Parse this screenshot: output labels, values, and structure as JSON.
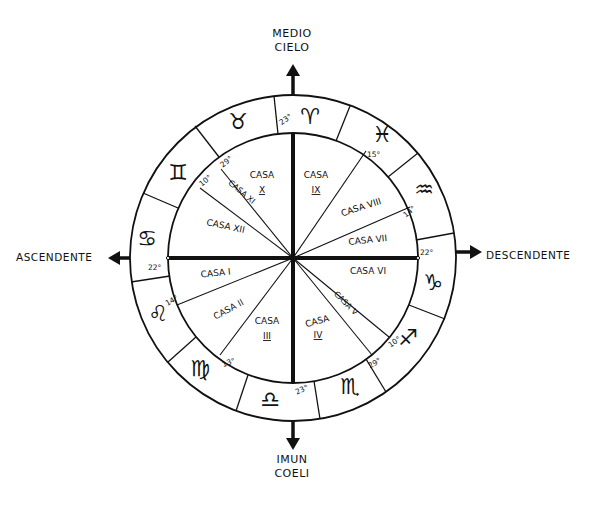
{
  "center": {
    "x": 293,
    "y": 258
  },
  "radii": {
    "outer": 163,
    "inner": 125
  },
  "axes": {
    "top": {
      "label_line1": "MEDIO",
      "label_line2": "CIELO",
      "degree": "23°"
    },
    "bottom": {
      "label_line1": "IMUN",
      "label_line2": "COELI",
      "degree": "23°"
    },
    "left": {
      "label": "ASCENDENTE",
      "degree": "22°"
    },
    "right": {
      "label": "DESCENDENTE",
      "degree": "22°"
    }
  },
  "houses": [
    {
      "id": "I",
      "label": "CASA I",
      "line1": "CASA I",
      "line2": ""
    },
    {
      "id": "II",
      "label": "CASA II",
      "line1": "CASA II",
      "line2": ""
    },
    {
      "id": "III",
      "label": "CASA III",
      "line1": "CASA",
      "line2": "III"
    },
    {
      "id": "IV",
      "label": "CASA IV",
      "line1": "CASA",
      "line2": "IV"
    },
    {
      "id": "V",
      "label": "CASA V",
      "line1": "CASA V",
      "line2": ""
    },
    {
      "id": "VI",
      "label": "CASA VI",
      "line1": "CASA VI",
      "line2": ""
    },
    {
      "id": "VII",
      "label": "CASA VII",
      "line1": "CASA VII",
      "line2": ""
    },
    {
      "id": "VIII",
      "label": "CASA VIII",
      "line1": "CASA VIII",
      "line2": ""
    },
    {
      "id": "IX",
      "label": "CASA IX",
      "line1": "CASA",
      "line2": "IX"
    },
    {
      "id": "X",
      "label": "CASA X",
      "line1": "CASA",
      "line2": "X"
    },
    {
      "id": "XI",
      "label": "CASA XI",
      "line1": "CASA XI",
      "line2": ""
    },
    {
      "id": "XII",
      "label": "CASA XII",
      "line1": "CASA XII",
      "line2": ""
    }
  ],
  "cusp_degrees": {
    "x_xi_29": "29°",
    "xi_xii_10": "10°",
    "i_ii_14": "14°",
    "ii_iii_13": "13°",
    "iv_v_29": "29°",
    "v_vi_10": "10°",
    "vii_viii_14": "14°",
    "viii_ix_15": "15°"
  },
  "signs": [
    {
      "name": "Ariete",
      "glyph": "♈"
    },
    {
      "name": "Toro",
      "glyph": "♉"
    },
    {
      "name": "Gemelli",
      "glyph": "♊"
    },
    {
      "name": "Cancro",
      "glyph": "♋"
    },
    {
      "name": "Leone",
      "glyph": "♌"
    },
    {
      "name": "Vergine",
      "glyph": "♍"
    },
    {
      "name": "Bilancia",
      "glyph": "♎"
    },
    {
      "name": "Scorpione",
      "glyph": "♏"
    },
    {
      "name": "Sagittario",
      "glyph": "♐"
    },
    {
      "name": "Capricorno",
      "glyph": "♑"
    },
    {
      "name": "Acquario",
      "glyph": "♒"
    },
    {
      "name": "Pesci",
      "glyph": "♓"
    }
  ],
  "colors": {
    "ink": "#111111",
    "paper": "#ffffff"
  }
}
